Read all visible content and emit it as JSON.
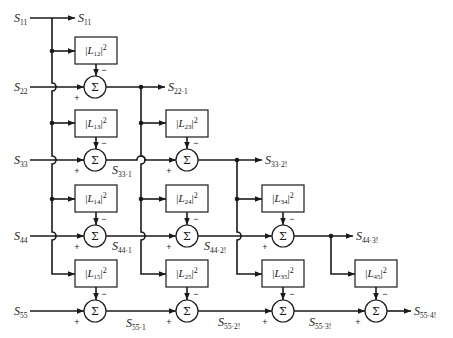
{
  "diagram": {
    "inputs": [
      {
        "symbol": "S",
        "sub": "11"
      },
      {
        "symbol": "S",
        "sub": "22"
      },
      {
        "symbol": "S",
        "sub": "33"
      },
      {
        "symbol": "S",
        "sub": "44"
      },
      {
        "symbol": "S",
        "sub": "55"
      }
    ],
    "outputs": [
      {
        "symbol": "S",
        "sub": "11"
      },
      {
        "symbol": "S",
        "sub": "22·1"
      },
      {
        "symbol": "S",
        "sub": "33·2!"
      },
      {
        "symbol": "S",
        "sub": "44·3!"
      },
      {
        "symbol": "S",
        "sub": "55·4!"
      }
    ],
    "intermediate": [
      {
        "symbol": "S",
        "sub": "33·1"
      },
      {
        "symbol": "S",
        "sub": "44·1"
      },
      {
        "symbol": "S",
        "sub": "44·2!"
      },
      {
        "symbol": "S",
        "sub": "55·1"
      },
      {
        "symbol": "S",
        "sub": "55·2!"
      },
      {
        "symbol": "S",
        "sub": "55·3!"
      }
    ],
    "boxes": [
      {
        "bar": "|",
        "var": "L",
        "sub": "12",
        "sup": "2"
      },
      {
        "bar": "|",
        "var": "L",
        "sub": "13",
        "sup": "2"
      },
      {
        "bar": "|",
        "var": "L",
        "sub": "14",
        "sup": "2"
      },
      {
        "bar": "|",
        "var": "L",
        "sub": "15",
        "sup": "2"
      },
      {
        "bar": "|",
        "var": "L",
        "sub": "23",
        "sup": "2"
      },
      {
        "bar": "|",
        "var": "L",
        "sub": "24",
        "sup": "2"
      },
      {
        "bar": "|",
        "var": "L",
        "sub": "25",
        "sup": "2"
      },
      {
        "bar": "|",
        "var": "L",
        "sub": "34",
        "sup": "2"
      },
      {
        "bar": "|",
        "var": "L",
        "sub": "35",
        "sup": "2"
      },
      {
        "bar": "|",
        "var": "L",
        "sub": "45",
        "sup": "2"
      }
    ],
    "sum_symbol": "Σ",
    "plus": "+",
    "minus": "−"
  }
}
